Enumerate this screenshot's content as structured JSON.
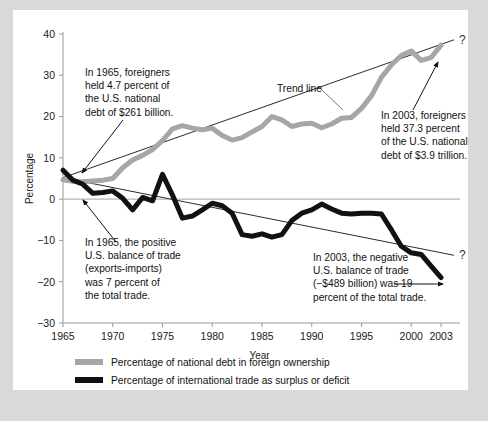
{
  "figure": {
    "background": "#ffffff",
    "page_background": "#d9d9d9"
  },
  "chart_data": {
    "type": "line",
    "title": "",
    "xlabel": "Year",
    "ylabel": "Percentage",
    "xlim": [
      1965,
      2004.5
    ],
    "ylim": [
      -30,
      40
    ],
    "xticks": [
      "1965",
      "1970",
      "1975",
      "1980",
      "1985",
      "1990",
      "1995",
      "2000",
      "2003"
    ],
    "xtick_values": [
      1965,
      1970,
      1975,
      1980,
      1985,
      1990,
      1995,
      2000,
      2003
    ],
    "yticks": [
      "40",
      "30",
      "20",
      "10",
      "0",
      "-10",
      "-20",
      "-30"
    ],
    "ytick_values": [
      40,
      30,
      20,
      10,
      0,
      -10,
      -20,
      -30
    ],
    "grid": false,
    "legend_position": "below",
    "zero_line": true,
    "series": [
      {
        "name": "Percentage of national debt in foreign ownership",
        "color": "#a6a6a6",
        "width": 5,
        "x": [
          1965,
          1966,
          1967,
          1968,
          1969,
          1970,
          1971,
          1972,
          1973,
          1974,
          1975,
          1976,
          1977,
          1978,
          1979,
          1980,
          1981,
          1982,
          1983,
          1984,
          1985,
          1986,
          1987,
          1988,
          1989,
          1990,
          1991,
          1992,
          1993,
          1994,
          1995,
          1996,
          1997,
          1998,
          1999,
          2000,
          2001,
          2002,
          2003
        ],
        "values": [
          4.7,
          4.3,
          4.2,
          4.4,
          4.6,
          5.0,
          7.6,
          9.5,
          10.6,
          12.0,
          14.2,
          17.0,
          17.8,
          17.2,
          16.8,
          17.2,
          15.4,
          14.3,
          14.9,
          16.3,
          17.6,
          20.0,
          19.2,
          17.6,
          18.2,
          18.4,
          17.3,
          18.2,
          19.6,
          19.8,
          22.0,
          25.0,
          29.5,
          32.5,
          34.8,
          35.9,
          33.6,
          34.3,
          37.3
        ]
      },
      {
        "name": "Percentage of international trade as surplus or deficit",
        "color": "#111111",
        "width": 5,
        "x": [
          1965,
          1966,
          1967,
          1968,
          1969,
          1970,
          1971,
          1972,
          1973,
          1974,
          1975,
          1976,
          1977,
          1978,
          1979,
          1980,
          1981,
          1982,
          1983,
          1984,
          1985,
          1986,
          1987,
          1988,
          1989,
          1990,
          1991,
          1992,
          1993,
          1994,
          1995,
          1996,
          1997,
          1998,
          1999,
          2000,
          2001,
          2002,
          2003
        ],
        "values": [
          7.0,
          4.6,
          3.6,
          1.4,
          1.6,
          2.0,
          0.2,
          -2.6,
          0.4,
          -0.4,
          6.0,
          1.0,
          -4.6,
          -4.1,
          -2.6,
          -1.0,
          -1.6,
          -3.4,
          -8.6,
          -9.0,
          -8.4,
          -9.2,
          -8.6,
          -5.2,
          -3.4,
          -2.6,
          -1.2,
          -2.4,
          -3.4,
          -3.6,
          -3.4,
          -3.4,
          -3.6,
          -7.4,
          -11.4,
          -13.0,
          -13.4,
          -16.2,
          -19.0
        ]
      }
    ],
    "trend_lines": [
      {
        "name": "debt-trend-line",
        "label": "Trend line",
        "x": [
          1965,
          2004.3
        ],
        "y": [
          5.2,
          38.6
        ],
        "end_marker": "?"
      },
      {
        "name": "trade-trend-line",
        "label": "",
        "x": [
          1965.4,
          2004.3
        ],
        "y": [
          5.0,
          -13.6
        ],
        "end_marker": "?"
      }
    ],
    "annotations": [
      {
        "name": "annotation-1965-debt",
        "lines": [
          "In 1965, foreigners",
          "held 4.7 percent of",
          "the U.S. national",
          "debt of $261 billion."
        ],
        "text_x": 72,
        "text_y": 66,
        "arrow": {
          "from": [
            110,
            110
          ],
          "to": [
            69,
            163
          ]
        }
      },
      {
        "name": "annotation-2003-debt",
        "lines": [
          "In 2003, foreigners",
          "held 37.3 percent",
          "of the U.S. national",
          "debt of $3.9 trillion."
        ],
        "text_x": 368,
        "text_y": 109,
        "arrow": {
          "from": [
            400,
            100
          ],
          "to": [
            425,
            52
          ]
        }
      },
      {
        "name": "annotation-1965-trade",
        "lines": [
          "In 1965, the positive",
          "U.S. balance of trade",
          "(exports-imports)",
          "was 7 percent of",
          "the total trade."
        ],
        "text_x": 72,
        "text_y": 236,
        "arrow": {
          "from": [
            103,
            232
          ],
          "to": [
            70,
            190
          ]
        }
      },
      {
        "name": "annotation-2003-trade",
        "lines": [
          "In 2003, the negative",
          "U.S. balance of trade",
          "(−$489 billion) was 19",
          "percent of the total trade."
        ],
        "text_x": 300,
        "text_y": 251,
        "arrow": {
          "from": [
            381,
            274
          ],
          "to": [
            430,
            274
          ]
        }
      }
    ],
    "trend_label": {
      "text": "Trend line",
      "x": 264,
      "y": 82,
      "leader_to": [
        330,
        100
      ]
    }
  },
  "legend": {
    "items": [
      {
        "label": "Percentage of national debt in foreign ownership",
        "color": "#a6a6a6",
        "swatch": "thick-gray-line"
      },
      {
        "label": "Percentage of international trade as surplus or deficit",
        "color": "#111111",
        "swatch": "thick-black-line"
      }
    ]
  }
}
